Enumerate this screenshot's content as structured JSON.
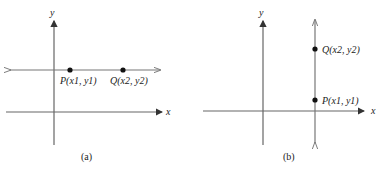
{
  "figure": {
    "panels": [
      {
        "id": "a",
        "caption": "(a)",
        "axis_x_label": "x",
        "axis_y_label": "y",
        "line_orientation": "horizontal",
        "points": [
          {
            "name": "P",
            "label": "P(x1, y1)"
          },
          {
            "name": "Q",
            "label": "Q(x2, y2)"
          }
        ]
      },
      {
        "id": "b",
        "caption": "(b)",
        "axis_x_label": "x",
        "axis_y_label": "y",
        "line_orientation": "vertical",
        "points": [
          {
            "name": "Q",
            "label": "Q(x2, y2)"
          },
          {
            "name": "P",
            "label": "P(x1, y1)"
          }
        ]
      }
    ],
    "colors": {
      "line": "#666666",
      "point": "#111111",
      "text": "#222222"
    }
  }
}
